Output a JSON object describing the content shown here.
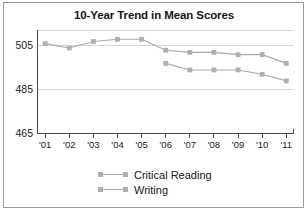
{
  "chart_data": {
    "type": "line",
    "title": "10-Year Trend in Mean Scores",
    "xlabel": "",
    "ylabel": "",
    "categories": [
      "'01",
      "'02",
      "'03",
      "'04",
      "'05",
      "'06",
      "'07",
      "'08",
      "'09",
      "'10",
      "'11"
    ],
    "ylim": [
      465,
      512
    ],
    "yticks": [
      465,
      485,
      505
    ],
    "ytick_labels": [
      "465",
      "485",
      "505"
    ],
    "grid": true,
    "legend_position": "bottom",
    "series": [
      {
        "name": "Critical Reading",
        "color": "#a9a9a9",
        "values": [
          506,
          504,
          507,
          508,
          508,
          503,
          502,
          502,
          501,
          501,
          497
        ],
        "x": [
          "'01",
          "'02",
          "'03",
          "'04",
          "'05",
          "'06",
          "'07",
          "'08",
          "'09",
          "'10",
          "'11"
        ]
      },
      {
        "name": "Writing",
        "color": "#a9a9a9",
        "values": [
          null,
          null,
          null,
          null,
          null,
          497,
          494,
          494,
          494,
          492,
          489
        ],
        "x": [
          "'01",
          "'02",
          "'03",
          "'04",
          "'05",
          "'06",
          "'07",
          "'08",
          "'09",
          "'10",
          "'11"
        ]
      }
    ]
  },
  "legend": {
    "items": [
      {
        "label": "Critical Reading"
      },
      {
        "label": "Writing"
      }
    ]
  },
  "colors": {
    "series": "#a9a9a9",
    "marker": "#b0b0b0",
    "axis": "#4a4a4a",
    "grid": "#d8d8d8",
    "border": "#9a9a9a",
    "text": "#151515"
  }
}
